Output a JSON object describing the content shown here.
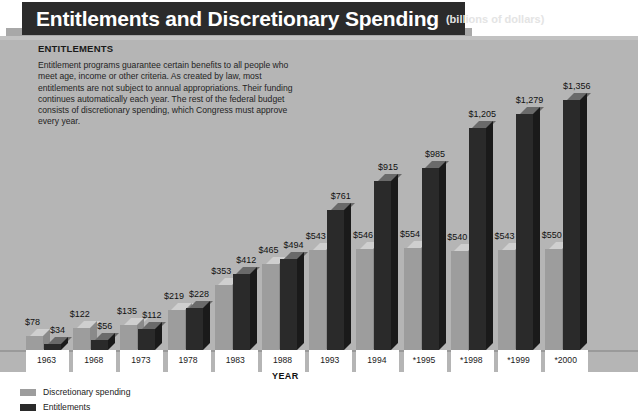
{
  "header": {
    "title": "Entitlements and Discretionary Spending",
    "units": "(billions of dollars)"
  },
  "description": {
    "heading": "ENTITLEMENTS",
    "body": "Entitlement programs guarantee certain benefits to all people who meet age, income or other criteria. As created by law, most entitlements are not subject to annual appropriations. Their funding continues automatically each year. The rest of the federal budget consists of discretionary spending, which Congress must approve every year."
  },
  "legend": [
    {
      "label": "Discretionary spending",
      "color": "#9d9d9d"
    },
    {
      "label": "Entitlements",
      "color": "#2a2a2a"
    }
  ],
  "chart_data": {
    "type": "bar",
    "title": "Entitlements and Discretionary Spending",
    "subtitle": "(billions of dollars)",
    "xlabel": "YEAR",
    "ylabel": "",
    "ylim": [
      0,
      1400
    ],
    "grid": false,
    "legend_position": "bottom-left",
    "categories": [
      "1963",
      "1968",
      "1973",
      "1978",
      "1983",
      "1988",
      "1993",
      "1994",
      "*1995",
      "*1998",
      "*1999",
      "*2000"
    ],
    "series": [
      {
        "name": "Discretionary spending",
        "color": "#9d9d9d",
        "values": [
          78,
          122,
          135,
          219,
          353,
          465,
          543,
          546,
          554,
          540,
          543,
          550
        ]
      },
      {
        "name": "Entitlements",
        "color": "#2a2a2a",
        "values": [
          34,
          56,
          112,
          228,
          412,
          494,
          761,
          915,
          985,
          1205,
          1279,
          1356
        ]
      }
    ],
    "value_labels": {
      "Discretionary spending": [
        "$78",
        "$122",
        "$135",
        "$219",
        "$353",
        "$465",
        "$543",
        "$546",
        "$554",
        "$540",
        "$543",
        "$550"
      ],
      "Entitlements": [
        "$34",
        "$56",
        "$112",
        "$228",
        "$412",
        "$494",
        "$761",
        "$915",
        "$985",
        "$1,205",
        "$1,279",
        "$1,356"
      ]
    },
    "note": "* denotes estimated or projected years"
  },
  "colors": {
    "panel_background": "#b5b5b5",
    "title_band": "#2b2b2b",
    "discretionary": "#9d9d9d",
    "entitlements": "#2a2a2a",
    "page_background": "#ffffff"
  }
}
